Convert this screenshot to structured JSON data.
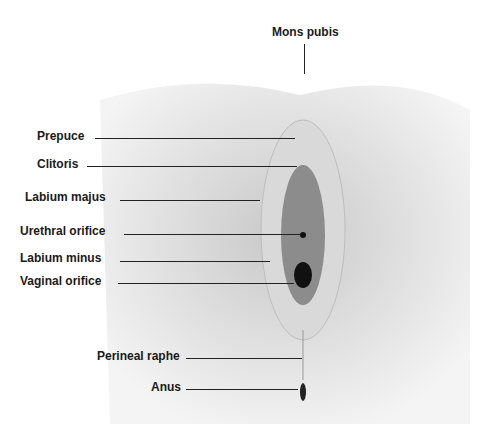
{
  "diagram": {
    "type": "anatomical illustration",
    "labels": [
      {
        "id": "mons",
        "text": "Mons pubis"
      },
      {
        "id": "prepuce",
        "text": "Prepuce"
      },
      {
        "id": "clitoris",
        "text": "Clitoris"
      },
      {
        "id": "labium_majus",
        "text": "Labium majus"
      },
      {
        "id": "urethral",
        "text": "Urethral orifice"
      },
      {
        "id": "labium_minus",
        "text": "Labium minus"
      },
      {
        "id": "vaginal",
        "text": "Vaginal orifice"
      },
      {
        "id": "perineal",
        "text": "Perineal raphe"
      },
      {
        "id": "anus",
        "text": "Anus"
      }
    ]
  }
}
